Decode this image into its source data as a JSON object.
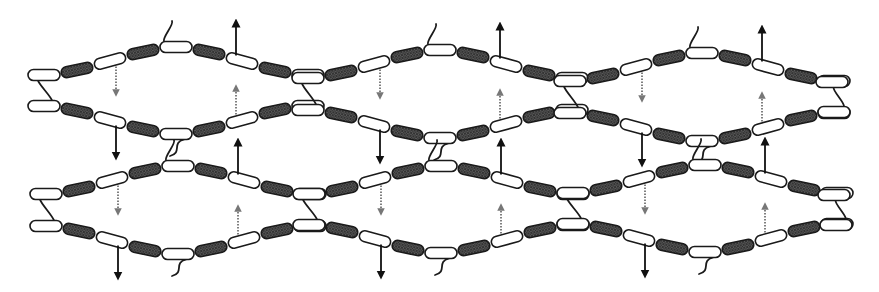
{
  "figure": {
    "colors": {
      "background": "#ffffff",
      "outline": "#1a1a1a",
      "white_segment": "#ffffff",
      "dark_segment": "#4a4a4a",
      "solid_arrow": "#111111",
      "dotted_arrow": "#555555"
    },
    "segment": {
      "length": 32,
      "height": 11,
      "spacing": 33,
      "pattern": [
        "white",
        "dark"
      ]
    },
    "chain_offsets_top": [
      0,
      -5,
      -14,
      -23,
      -28,
      -23,
      -14,
      -5,
      0
    ],
    "chain_offsets_bottom": [
      0,
      5,
      14,
      23,
      28,
      23,
      14,
      5,
      0
    ],
    "rows": [
      {
        "name": "row-1",
        "cells": [
          {
            "x0": 28,
            "yT": 75,
            "yB": 106
          },
          {
            "x0": 292,
            "yT": 78,
            "yB": 110
          },
          {
            "x0": 554,
            "yT": 81,
            "yB": 113
          }
        ],
        "end": {
          "x0": 816,
          "yT": 82,
          "yB": 112
        }
      },
      {
        "name": "row-2",
        "cells": [
          {
            "x0": 30,
            "yT": 194,
            "yB": 226
          },
          {
            "x0": 293,
            "yT": 194,
            "yB": 225
          },
          {
            "x0": 557,
            "yT": 193,
            "yB": 224
          }
        ],
        "end": {
          "x0": 818,
          "yT": 195,
          "yB": 225
        }
      }
    ],
    "arrows": {
      "solid_up_per_cell": "from 7th capsule of top chain, pointing up",
      "solid_down_per_cell": "from 3rd capsule of bottom chain, pointing down",
      "dotted_down_per_cell": "from 3rd capsule of top chain into cell interior",
      "dotted_up_per_cell": "from 7th capsule of bottom chain into cell interior"
    },
    "legend": []
  }
}
